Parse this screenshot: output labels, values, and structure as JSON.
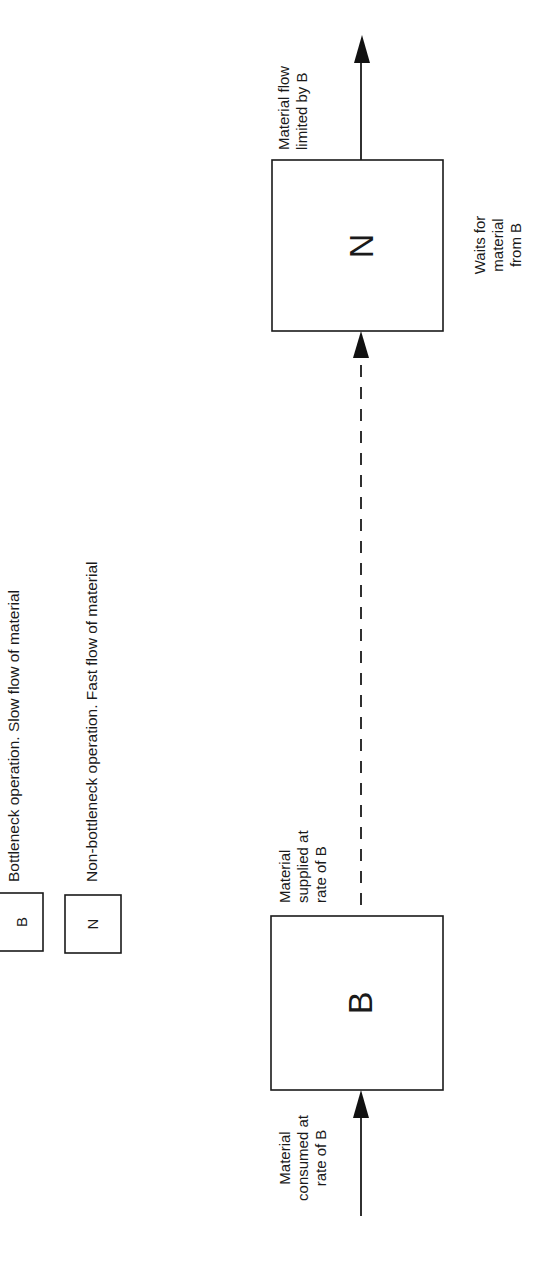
{
  "diagram": {
    "orientation": "rotated-90-ccw",
    "legend": [
      {
        "symbol": "B",
        "description": "Bottleneck operation. Slow flow of material"
      },
      {
        "symbol": "N",
        "description": "Non-bottleneck operation. Fast flow of material"
      }
    ],
    "nodes": {
      "bottleneck": {
        "label": "B"
      },
      "non_bottleneck": {
        "label": "N"
      }
    },
    "annotations": {
      "input": [
        "Material",
        "consumed at",
        "rate of B"
      ],
      "between": [
        "Material",
        "supplied at",
        "rate of B"
      ],
      "output": [
        "Material flow",
        "limited by B"
      ],
      "waiting": [
        "Waits for",
        "material",
        "from B"
      ]
    },
    "edges": [
      {
        "from": "input",
        "to": "B",
        "style": "solid"
      },
      {
        "from": "B",
        "to": "N",
        "style": "dashed"
      },
      {
        "from": "N",
        "to": "output",
        "style": "solid"
      }
    ],
    "colors": {
      "ink": "#1a1a1a",
      "background": "#ffffff"
    }
  }
}
